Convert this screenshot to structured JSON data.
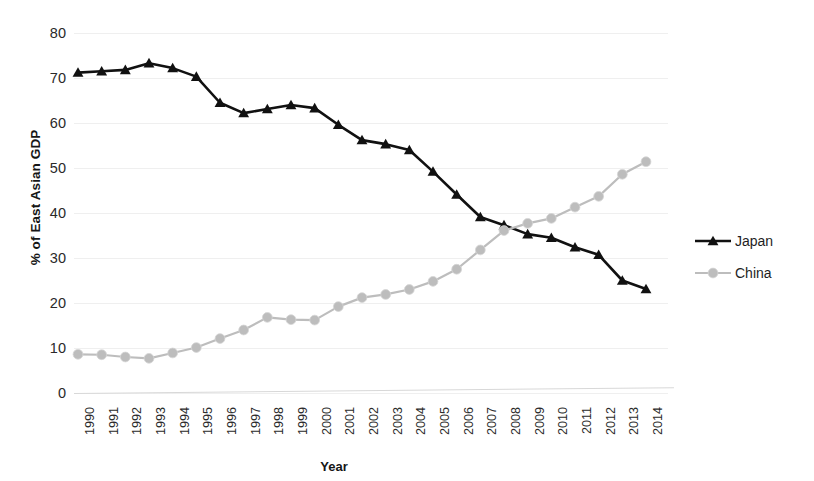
{
  "chart_data": {
    "type": "line",
    "title": "",
    "xlabel": "Year",
    "ylabel": "% of East Asian GDP",
    "x": [
      1990,
      1991,
      1992,
      1993,
      1994,
      1995,
      1996,
      1997,
      1998,
      1999,
      2000,
      2001,
      2002,
      2003,
      2004,
      2005,
      2006,
      2007,
      2008,
      2009,
      2010,
      2011,
      2012,
      2013,
      2014
    ],
    "categories": [
      "1990",
      "1991",
      "1992",
      "1993",
      "1994",
      "1995",
      "1996",
      "1997",
      "1998",
      "1999",
      "2000",
      "2001",
      "2002",
      "2003",
      "2004",
      "2005",
      "2006",
      "2007",
      "2008",
      "2009",
      "2010",
      "2011",
      "2012",
      "2013",
      "2014"
    ],
    "series": [
      {
        "name": "Japan",
        "color": "#111111",
        "marker": "triangle",
        "values": [
          71.2,
          71.5,
          71.8,
          73.3,
          72.2,
          70.3,
          64.5,
          62.2,
          63.1,
          64.0,
          63.3,
          59.6,
          56.2,
          55.3,
          54.0,
          49.2,
          44.1,
          39.1,
          37.3,
          35.3,
          34.5,
          32.4,
          30.7,
          25.0,
          23.1
        ]
      },
      {
        "name": "China",
        "color": "#bdbdbd",
        "marker": "circle",
        "values": [
          8.6,
          8.5,
          8.0,
          7.7,
          8.9,
          10.1,
          12.1,
          14.0,
          16.8,
          16.3,
          16.2,
          19.2,
          21.2,
          21.9,
          23.0,
          24.8,
          27.5,
          31.8,
          36.1,
          37.7,
          38.8,
          41.3,
          43.7,
          48.6,
          51.4
        ]
      }
    ],
    "ylim": [
      0,
      80
    ],
    "y_ticks": [
      0,
      10,
      20,
      30,
      40,
      50,
      60,
      70,
      80
    ],
    "ytick_labels": [
      "0",
      "10",
      "20",
      "30",
      "40",
      "50",
      "60",
      "70",
      "80"
    ],
    "grid": true,
    "legend_position": "right",
    "legend_entries": [
      "Japan",
      "China"
    ]
  },
  "legend": {
    "items": [
      {
        "label": "Japan",
        "icon": "black-line-triangle-marker"
      },
      {
        "label": "China",
        "icon": "gray-line-circle-marker"
      }
    ]
  },
  "axes": {
    "x_title": "Year",
    "y_title": "% of East Asian GDP"
  }
}
